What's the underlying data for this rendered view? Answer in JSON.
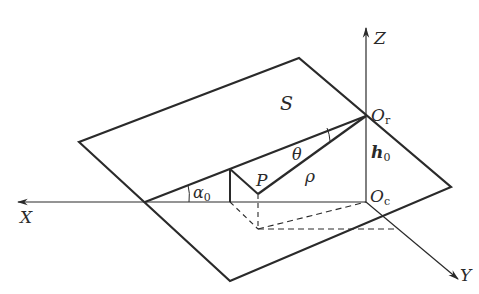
{
  "diagram": {
    "colors": {
      "line": "#2a2a2a",
      "background": "#ffffff"
    },
    "labels": {
      "plane": "S",
      "axis_x": "X",
      "axis_y": "Y",
      "axis_z": "Z",
      "origin_r_main": "O",
      "origin_r_sub": "r",
      "origin_c_main": "O",
      "origin_c_sub": "c",
      "point_p": "P",
      "height_main": "h",
      "height_sub": "0",
      "angle_alpha_main": "α",
      "angle_alpha_sub": "0",
      "angle_theta": "θ",
      "distance_rho": "ρ"
    }
  }
}
